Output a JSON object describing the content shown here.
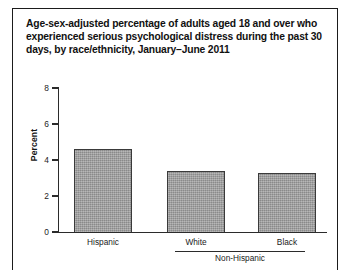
{
  "figure": {
    "title_line1": "Age-sex-adjusted percentage of adults aged 18 and over who",
    "title_line2": "experienced serious psychological distress during the past",
    "title_line3": "30 days, by race/ethnicity, January–June 2011",
    "frame_color": "#1b1b1b",
    "bar_fill_color": "#9b9b9b",
    "bar_outline_color": "#3a3a3a",
    "axis_color": "#2b2b2b"
  },
  "chart_data": {
    "type": "bar",
    "title": "Age-sex-adjusted percentage of adults aged 18 and over who experienced serious psychological distress during the past 30 days, by race/ethnicity, January–June 2011",
    "categories": [
      "Hispanic",
      "White",
      "Black"
    ],
    "values": [
      4.6,
      3.4,
      3.3
    ],
    "group_brackets": [
      {
        "label": "Non-Hispanic",
        "categories": [
          "White",
          "Black"
        ]
      }
    ],
    "xlabel": "",
    "ylabel": "Percent",
    "ylim": [
      0,
      8
    ],
    "yticks": [
      0,
      2,
      4,
      6,
      8
    ],
    "ytick_labels": [
      "0",
      "2",
      "4",
      "6",
      "8"
    ],
    "grid": false,
    "legend": false
  }
}
